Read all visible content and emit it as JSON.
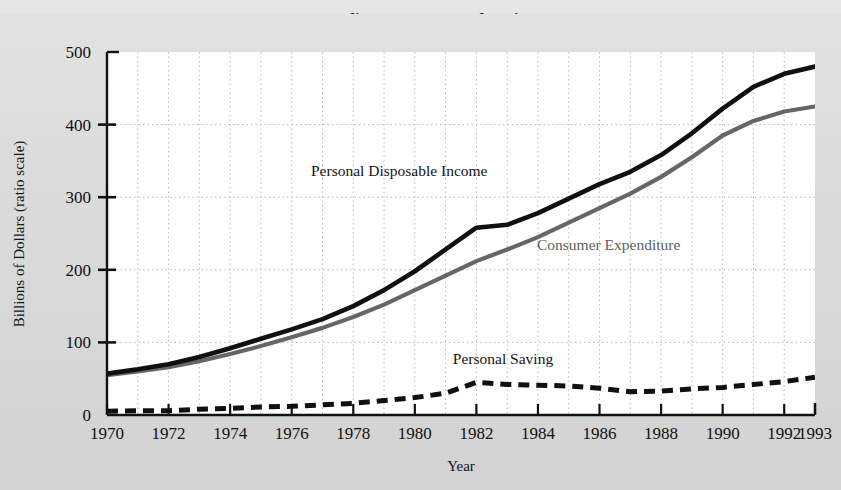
{
  "figure": {
    "title_partial": "Consumer Expenditure, Income, and Saving, 1970-1993",
    "background_color": "#dcdcdc",
    "plot_background_color": "#ffffff"
  },
  "axes": {
    "y": {
      "label": "Billions of Dollars (ratio scale)",
      "ticks": [
        "0",
        "100",
        "200",
        "300",
        "400",
        "500"
      ],
      "min": 0,
      "max": 500
    },
    "x": {
      "label": "Year",
      "ticks": [
        "1970",
        "1972",
        "1974",
        "1976",
        "1978",
        "1980",
        "1982",
        "1984",
        "1986",
        "1988",
        "1990",
        "1992",
        "1993"
      ],
      "min": 1970,
      "max": 1993
    }
  },
  "series_labels": {
    "income": "Personal Disposable Income",
    "expenditure": "Consumer Expenditure",
    "saving": "Personal Saving"
  },
  "colors": {
    "income_line": "#101010",
    "expenditure_line": "#666666",
    "saving_line": "#101010",
    "gridline": "#b9b9b9",
    "axis": "#111111"
  },
  "chart_data": {
    "type": "line",
    "title": "Consumer Expenditure, Income, and Saving, 1970-1993",
    "xlabel": "Year",
    "ylabel": "Billions of Dollars (ratio scale)",
    "xlim": [
      1970,
      1993
    ],
    "ylim": [
      0,
      500
    ],
    "grid": true,
    "legend_position": "inline-annotations",
    "x": [
      1970,
      1971,
      1972,
      1973,
      1974,
      1975,
      1976,
      1977,
      1978,
      1979,
      1980,
      1981,
      1982,
      1983,
      1984,
      1985,
      1986,
      1987,
      1988,
      1989,
      1990,
      1991,
      1992,
      1993
    ],
    "series": [
      {
        "name": "Personal Disposable Income",
        "style": "solid",
        "color": "#101010",
        "values": [
          57,
          63,
          70,
          80,
          92,
          105,
          118,
          132,
          150,
          172,
          198,
          228,
          258,
          262,
          278,
          298,
          318,
          335,
          358,
          388,
          422,
          452,
          470,
          480
        ]
      },
      {
        "name": "Consumer Expenditure",
        "style": "solid",
        "color": "#666666",
        "values": [
          55,
          60,
          66,
          74,
          84,
          95,
          107,
          120,
          135,
          152,
          172,
          192,
          212,
          228,
          245,
          265,
          285,
          305,
          328,
          355,
          385,
          405,
          418,
          425
        ]
      },
      {
        "name": "Personal Saving",
        "style": "dashed",
        "color": "#101010",
        "values": [
          5,
          6,
          6,
          8,
          9,
          11,
          12,
          14,
          16,
          20,
          24,
          30,
          45,
          42,
          41,
          40,
          37,
          32,
          33,
          36,
          38,
          42,
          46,
          52
        ]
      }
    ]
  }
}
